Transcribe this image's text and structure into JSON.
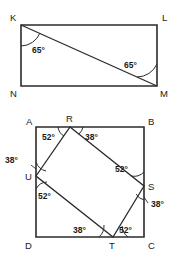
{
  "figures": [
    {
      "name": "rectangle-with-diagonal",
      "shape": "rectangle",
      "vertices": [
        {
          "id": "K",
          "label": "K",
          "position": "top-left"
        },
        {
          "id": "L",
          "label": "L",
          "position": "top-right"
        },
        {
          "id": "N",
          "label": "N",
          "position": "bottom-left"
        },
        {
          "id": "M",
          "label": "M",
          "position": "bottom-right"
        }
      ],
      "diagonal": "K-M",
      "angles": [
        {
          "id": "angle-at-K",
          "value": "65°",
          "at_vertex": "K"
        },
        {
          "id": "angle-at-M",
          "value": "65°",
          "at_vertex": "M"
        }
      ]
    },
    {
      "name": "square-with-inscribed-quadrilateral",
      "shape": "square",
      "vertices": [
        {
          "id": "A",
          "label": "A",
          "position": "top-left"
        },
        {
          "id": "B",
          "label": "B",
          "position": "top-right"
        },
        {
          "id": "C",
          "label": "C",
          "position": "bottom-right"
        },
        {
          "id": "D",
          "label": "D",
          "position": "bottom-left"
        }
      ],
      "inner_vertices": [
        {
          "id": "R",
          "label": "R",
          "on_side": "AB"
        },
        {
          "id": "S",
          "label": "S",
          "on_side": "BC"
        },
        {
          "id": "T",
          "label": "T",
          "on_side": "DC"
        },
        {
          "id": "U",
          "label": "U",
          "on_side": "AD"
        }
      ],
      "inner_quadrilateral": "R-S-T-U",
      "angles": [
        {
          "id": "angle-R-left",
          "value": "52°",
          "at_vertex": "R"
        },
        {
          "id": "angle-R-right",
          "value": "38°",
          "at_vertex": "R"
        },
        {
          "id": "angle-U-top",
          "value": "38°",
          "at_vertex": "U"
        },
        {
          "id": "angle-U-bottom",
          "value": "52°",
          "at_vertex": "U"
        },
        {
          "id": "angle-S-top",
          "value": "52°",
          "at_vertex": "S"
        },
        {
          "id": "angle-S-bottom",
          "value": "38°",
          "at_vertex": "S"
        },
        {
          "id": "angle-T-left",
          "value": "38°",
          "at_vertex": "T"
        },
        {
          "id": "angle-T-right",
          "value": "52°",
          "at_vertex": "T"
        }
      ]
    }
  ],
  "colors": {
    "stroke": "#2b2b2b",
    "text": "#1a1a1a",
    "background": "#ffffff"
  }
}
